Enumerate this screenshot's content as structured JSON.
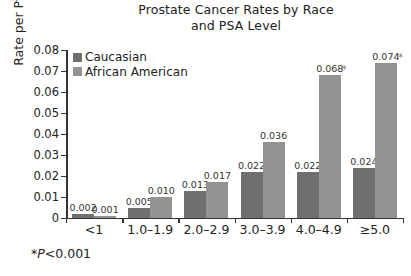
{
  "chart_data": {
    "type": "bar",
    "title": "Prostate Cancer Rates by Race and PSA Level",
    "title_lines": [
      "Prostate Cancer Rates by Race",
      "and PSA Level"
    ],
    "xlabel": "",
    "ylabel": "Rate per Pt year",
    "ylim": [
      0,
      0.08
    ],
    "ytick_labels": [
      "0.08",
      "0.07",
      "0.06",
      "0.05",
      "0.04",
      "0.03",
      "0.02",
      "0.01",
      "0"
    ],
    "ytick_values": [
      0.08,
      0.07,
      0.06,
      0.05,
      0.04,
      0.03,
      0.02,
      0.01,
      0
    ],
    "grid": false,
    "legend_position": "top-left inside",
    "categories": [
      "<1",
      "1.0–1.9",
      "2.0–2.9",
      "3.0–3.9",
      "4.0–4.9",
      "≥5.0"
    ],
    "series": [
      {
        "name": "Caucasian",
        "color": "#6f6f6f",
        "values": [
          0.002,
          0.005,
          0.013,
          0.022,
          0.022,
          0.024
        ],
        "labels": [
          "0.002",
          "0.005",
          "0.013",
          "0.022",
          "0.022",
          "0.024"
        ],
        "significance": [
          false,
          false,
          false,
          false,
          false,
          false
        ]
      },
      {
        "name": "African American",
        "color": "#939393",
        "values": [
          0.001,
          0.01,
          0.017,
          0.036,
          0.068,
          0.074
        ],
        "labels": [
          "0.001",
          "0.010",
          "0.017",
          "0.036",
          "0.068",
          "0.074"
        ],
        "significance": [
          false,
          false,
          false,
          false,
          true,
          true
        ]
      }
    ],
    "annotations": [
      {
        "name": "significance-footnote",
        "marker": "*",
        "text_italic": "P",
        "text": "<0.001",
        "full": "*P<0.001"
      }
    ]
  },
  "footnote": {
    "marker": "*",
    "p_symbol": "P",
    "value": "<0.001"
  }
}
